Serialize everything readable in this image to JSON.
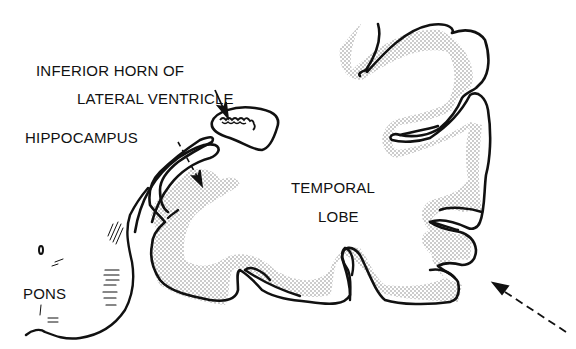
{
  "diagram": {
    "type": "anatomical-cross-section",
    "colors": {
      "ink": "#111111",
      "background": "#ffffff",
      "stipple": "#9a9a9a"
    },
    "labels": {
      "inferior_horn_line1": "INFERIOR HORN OF",
      "inferior_horn_line2": "LATERAL VENTRICLE",
      "hippocampus": "HIPPOCAMPUS",
      "temporal_lobe_line1": "TEMPORAL",
      "temporal_lobe_line2": "LOBE",
      "pons": "PONS"
    },
    "arrows": [
      {
        "name": "inferior-horn-pointer",
        "style": "solid",
        "target": "inferior horn of lateral ventricle"
      },
      {
        "name": "hippocampus-pointer",
        "style": "dashed",
        "target": "hippocampus"
      },
      {
        "name": "approach-direction-arrow",
        "style": "dashed",
        "target": "lateral temporal surface"
      }
    ]
  }
}
